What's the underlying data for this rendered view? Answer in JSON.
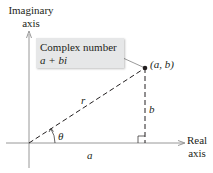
{
  "diagram": {
    "type": "complex-plane",
    "axes": {
      "vertical_label_line1": "Imaginary",
      "vertical_label_line2": "axis",
      "horizontal_label_line1": "Real",
      "horizontal_label_line2": "axis"
    },
    "callout": {
      "line1": "Complex number",
      "line2": "a + bi"
    },
    "point_label": "(a, b)",
    "labels": {
      "hypotenuse": "r",
      "vertical_leg": "b",
      "horizontal_leg": "a",
      "angle": "θ"
    },
    "colors": {
      "ink": "#231f20",
      "callout_fill": "#e6e7e8",
      "axis": "#7f7f7f"
    }
  }
}
